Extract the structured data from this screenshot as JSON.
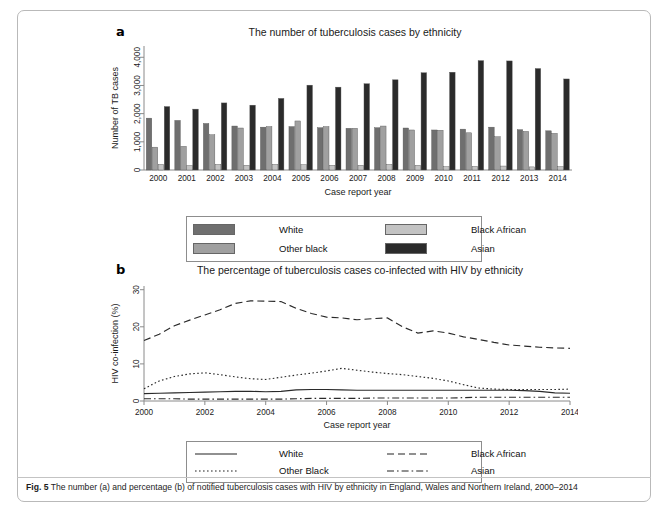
{
  "figure": {
    "caption_prefix": "Fig. 5",
    "caption_text": " The number (a) and percentage (b) of notified tuberculosis cases with HIV by ethnicity in England, Wales and Northern Ireland, 2000–2014"
  },
  "panel_a": {
    "letter": "a",
    "title": "The number of tuberculosis cases by ethnicity",
    "legend": {
      "items": [
        {
          "label": "White",
          "color": "#6f6f6f"
        },
        {
          "label": "Black African",
          "color": "#c3c3c3"
        },
        {
          "label": "Other black",
          "color": "#a0a0a0"
        },
        {
          "label": "Asian",
          "color": "#2b2b2b"
        }
      ]
    }
  },
  "panel_b": {
    "letter": "b",
    "title": "The percentage of tuberculosis cases co-infected with HIV by ethnicity",
    "legend": {
      "items": [
        {
          "label": "White",
          "dash": "none"
        },
        {
          "label": "Black African",
          "dash": "long-dash"
        },
        {
          "label": "Other Black",
          "dash": "dotted"
        },
        {
          "label": "Asian",
          "dash": "dash-dot"
        }
      ]
    }
  },
  "chart_data": [
    {
      "type": "bar",
      "title": "The number of tuberculosis cases by ethnicity",
      "xlabel": "Case report year",
      "ylabel": "Number of TB cases",
      "ylim": [
        0,
        4400
      ],
      "yticks": [
        0,
        1000,
        2000,
        3000,
        4000
      ],
      "ytick_labels": [
        "0",
        "1,000",
        "2,000",
        "3,000",
        "4,000"
      ],
      "grid": false,
      "legend_position": "below",
      "categories": [
        "2000",
        "2001",
        "2002",
        "2003",
        "2004",
        "2005",
        "2006",
        "2007",
        "2008",
        "2009",
        "2010",
        "2011",
        "2012",
        "2013",
        "2014"
      ],
      "series": [
        {
          "name": "White",
          "color": "#6f6f6f",
          "values": [
            1840,
            1760,
            1650,
            1560,
            1520,
            1540,
            1500,
            1480,
            1500,
            1490,
            1420,
            1450,
            1520,
            1430,
            1390
          ]
        },
        {
          "name": "Other black",
          "color": "#a0a0a0",
          "values": [
            810,
            840,
            1250,
            1490,
            1540,
            1740,
            1540,
            1480,
            1560,
            1420,
            1410,
            1320,
            1180,
            1370,
            1300
          ]
        },
        {
          "name": "Black African",
          "color": "#c3c3c3",
          "values": [
            200,
            160,
            200,
            170,
            200,
            190,
            170,
            170,
            200,
            170,
            120,
            130,
            140,
            110,
            120
          ]
        },
        {
          "name": "Asian",
          "color": "#2b2b2b",
          "values": [
            2250,
            2160,
            2380,
            2300,
            2540,
            3010,
            2940,
            3060,
            3200,
            3450,
            3470,
            3880,
            3870,
            3600,
            3230
          ]
        }
      ]
    },
    {
      "type": "line",
      "title": "The percentage of tuberculosis cases co-infected with HIV by ethnicity",
      "xlabel": "Case report year",
      "ylabel": "HIV co-infection (%)",
      "ylim": [
        0,
        31
      ],
      "yticks": [
        0,
        10,
        20,
        30
      ],
      "ytick_labels": [
        "0",
        "10",
        "20",
        "30"
      ],
      "xlim": [
        2000,
        2014
      ],
      "xticks": [
        2000,
        2002,
        2004,
        2006,
        2008,
        2010,
        2012,
        2014
      ],
      "xtick_labels": [
        "2000",
        "2002",
        "2004",
        "2006",
        "2008",
        "2010",
        "2012",
        "2014"
      ],
      "grid": false,
      "legend_position": "below",
      "x": [
        2000,
        2000.5,
        2001,
        2001.5,
        2002,
        2002.5,
        2003,
        2003.5,
        2004,
        2004.5,
        2005,
        2005.5,
        2006,
        2006.5,
        2007,
        2007.5,
        2008,
        2008.5,
        2009,
        2009.5,
        2010,
        2010.5,
        2011,
        2011.5,
        2012,
        2012.5,
        2013,
        2013.5,
        2014
      ],
      "series": [
        {
          "name": "White",
          "dash": "none",
          "values": [
            2.0,
            2.1,
            2.2,
            2.3,
            2.4,
            2.5,
            2.6,
            2.6,
            2.5,
            2.6,
            3.0,
            3.1,
            3.1,
            3.0,
            2.9,
            2.9,
            2.9,
            2.9,
            2.9,
            2.9,
            2.9,
            2.9,
            2.9,
            2.9,
            2.9,
            2.8,
            2.6,
            2.2,
            2.1
          ]
        },
        {
          "name": "Black African",
          "dash": "long-dash",
          "values": [
            16.3,
            18.0,
            20.3,
            21.8,
            23.2,
            24.6,
            26.3,
            27.0,
            26.9,
            26.8,
            25.0,
            23.6,
            22.6,
            22.4,
            21.9,
            22.2,
            22.4,
            20.0,
            18.3,
            18.9,
            18.3,
            17.3,
            16.6,
            15.8,
            15.1,
            14.8,
            14.5,
            14.3,
            14.2
          ]
        },
        {
          "name": "Other Black",
          "dash": "dotted",
          "values": [
            3.3,
            5.4,
            6.6,
            7.3,
            7.6,
            7.1,
            6.5,
            6.0,
            5.8,
            6.4,
            7.0,
            7.5,
            8.1,
            8.8,
            8.3,
            7.8,
            7.4,
            7.1,
            6.6,
            6.1,
            5.4,
            4.4,
            3.5,
            3.2,
            3.1,
            3.1,
            3.1,
            3.1,
            3.2
          ]
        },
        {
          "name": "Asian",
          "dash": "dash-dot",
          "values": [
            0.6,
            0.6,
            0.6,
            0.5,
            0.5,
            0.5,
            0.5,
            0.5,
            0.5,
            0.5,
            0.6,
            0.7,
            0.7,
            0.7,
            0.7,
            0.8,
            0.8,
            0.8,
            0.8,
            0.8,
            0.8,
            0.9,
            1.0,
            1.0,
            1.0,
            1.0,
            1.0,
            1.0,
            1.0
          ]
        }
      ]
    }
  ]
}
